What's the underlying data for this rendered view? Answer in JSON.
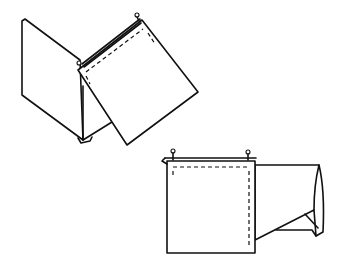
{
  "diagram": {
    "type": "line-illustration",
    "stroke_color": "#111111",
    "background": "#ffffff",
    "figures": [
      {
        "id": "step-1",
        "description": "Fabric piece folded open with a square panel pinned along top edge and tilted",
        "elements": [
          "left-panel",
          "tilted-square",
          "top-edge-double-line",
          "stitch-line-dashed",
          "pins",
          "bottom-corner-fold"
        ]
      },
      {
        "id": "step-2",
        "description": "Square panel pinned flat with stitch lines, remaining fabric folded to the right",
        "elements": [
          "square-panel",
          "top-edge-double-line",
          "stitch-line-dashed",
          "pins",
          "right-flap"
        ]
      }
    ]
  }
}
